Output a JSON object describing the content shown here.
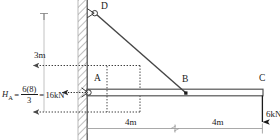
{
  "figure": {
    "type": "structural-free-body-diagram",
    "colors": {
      "line": "#3a3a3a",
      "member": "#555555",
      "text": "#1a1a1a",
      "hatch": "#808080",
      "dimension": "#9a9a9a",
      "dotted": "#4a4a4a",
      "background": "#ffffff"
    }
  },
  "joints": [
    {
      "id": "D",
      "label": "D",
      "x": 98,
      "y": 10,
      "kind": "pin-on-wall"
    },
    {
      "id": "A",
      "label": "A",
      "x": 88,
      "y": 92,
      "kind": "pin-on-wall"
    },
    {
      "id": "B",
      "label": "B",
      "x": 186,
      "y": 93,
      "kind": "beam-node"
    },
    {
      "id": "C",
      "label": "C",
      "x": 262,
      "y": 92,
      "kind": "free-end"
    }
  ],
  "labels": {
    "D": "D",
    "A": "A",
    "B": "B",
    "C": "C"
  },
  "reaction": {
    "symbol": "H",
    "subscript": "A",
    "numerator": "6(8)",
    "denominator": "3",
    "result": "16kN",
    "equals": "=",
    "direction": "left",
    "full_text": "H_A = 6(8)/3 = 16kN"
  },
  "loads": [
    {
      "id": "load-C",
      "label": "6kN",
      "magnitude": 6,
      "unit": "kN",
      "direction": "down",
      "applied_at": "C"
    }
  ],
  "dimensions": [
    {
      "id": "height-AD",
      "label": "3m",
      "value": 3,
      "unit": "m",
      "orientation": "vertical",
      "between": [
        "A",
        "D"
      ]
    },
    {
      "id": "span-AB",
      "label": "4m",
      "value": 4,
      "unit": "m",
      "orientation": "horizontal",
      "between": [
        "A",
        "B"
      ]
    },
    {
      "id": "span-BC",
      "label": "4m",
      "value": 4,
      "unit": "m",
      "orientation": "horizontal",
      "between": [
        "B",
        "C"
      ]
    }
  ],
  "members": [
    {
      "id": "beam-AC",
      "from": "A",
      "to": "C",
      "style": "hollow-rectangle"
    },
    {
      "id": "strut-DB",
      "from": "D",
      "to": "B",
      "style": "single-line"
    }
  ],
  "support": {
    "id": "wall",
    "type": "hatched-fixed-wall",
    "orientation": "vertical"
  }
}
